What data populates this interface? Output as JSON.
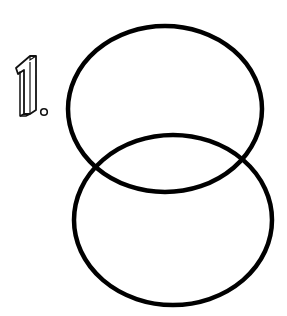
{
  "drawing": {
    "step_label": "1.",
    "step_number": "1",
    "description": "Two overlapping ovals, upper and lower, drawing step 1",
    "colors": {
      "background": "#ffffff",
      "stroke": "#000000"
    },
    "shapes": [
      {
        "name": "upper-oval",
        "cx": 165,
        "cy": 109,
        "rx": 97,
        "ry": 83
      },
      {
        "name": "lower-oval",
        "cx": 173,
        "cy": 220,
        "rx": 99,
        "ry": 85
      }
    ]
  }
}
